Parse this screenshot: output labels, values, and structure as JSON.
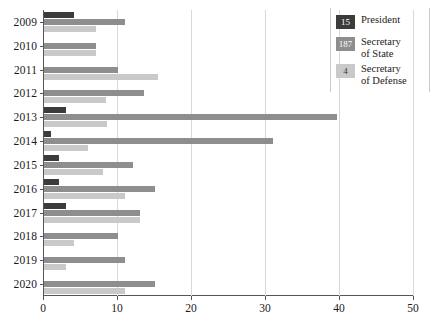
{
  "chart_data": {
    "type": "bar",
    "orientation": "horizontal",
    "title": "",
    "subtitle": "",
    "xlabel": "",
    "ylabel": "",
    "xlim": [
      0,
      50
    ],
    "ylim": null,
    "grid": true,
    "grid_axis": "x",
    "legend_position": "top-right",
    "xticks": [
      "0",
      "10",
      "20",
      "30",
      "40",
      "50"
    ],
    "xtick_values": [
      0,
      10,
      20,
      30,
      40,
      50
    ],
    "categories": [
      "2009",
      "2010",
      "2011",
      "2012",
      "2013",
      "2014",
      "2015",
      "2016",
      "2017",
      "2018",
      "2019",
      "2020"
    ],
    "series": [
      {
        "name": "President",
        "total": "15",
        "color": "#3b3b3b",
        "values": [
          4,
          0,
          0,
          0,
          3,
          1,
          2,
          2,
          3,
          0,
          0,
          0
        ]
      },
      {
        "name": "Secretary of State",
        "total": "187",
        "color": "#8e8e8e",
        "values": [
          11,
          7,
          10,
          13.5,
          39.6,
          31,
          12,
          15,
          13,
          10,
          11,
          15
        ]
      },
      {
        "name": "Secretary of Defense",
        "total": "4",
        "color": "#c9c9c9",
        "values": [
          7,
          7,
          15.4,
          8.4,
          8.5,
          6,
          8,
          11,
          13,
          4,
          3,
          11
        ]
      }
    ]
  },
  "legend": {
    "items": [
      {
        "count": "15",
        "label": "President",
        "swatch_class": "sw-president",
        "name": "legend-item-president"
      },
      {
        "count": "187",
        "label": "Secretary\nof State",
        "swatch_class": "sw-state",
        "name": "legend-item-secretary-of-state"
      },
      {
        "count": "4",
        "label": "Secretary\nof Defense",
        "swatch_class": "sw-defense",
        "name": "legend-item-secretary-of-defense"
      }
    ]
  }
}
